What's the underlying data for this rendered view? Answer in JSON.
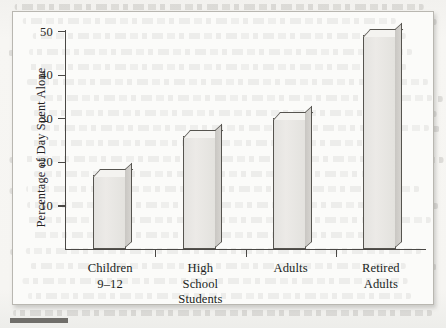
{
  "figure": {
    "media": "scanned-textbook-page",
    "frame_border_color": "#b9b7b1",
    "paper_color": "#f6f5f2"
  },
  "chart_data": {
    "type": "bar",
    "title": "",
    "xlabel": "",
    "ylabel": "Percentage of Day Spent Alone",
    "categories": [
      "Children 9–12",
      "High School Students",
      "Adults",
      "Retired Adults"
    ],
    "category_lines": [
      [
        "Children",
        "9–12"
      ],
      [
        "High",
        "School",
        "Students"
      ],
      [
        "Adults"
      ],
      [
        "Retired",
        "Adults"
      ]
    ],
    "values": [
      17,
      26,
      30,
      49
    ],
    "ylim": [
      0,
      50
    ],
    "yticks": [
      10,
      20,
      30,
      40,
      50
    ],
    "ytick_labels": [
      "10",
      "20",
      "30",
      "40",
      "50"
    ],
    "grid": false,
    "legend": null,
    "bar_style": "3d-extruded",
    "bar_fill": "#e8e7e3",
    "bar_outline": "#56544f"
  }
}
